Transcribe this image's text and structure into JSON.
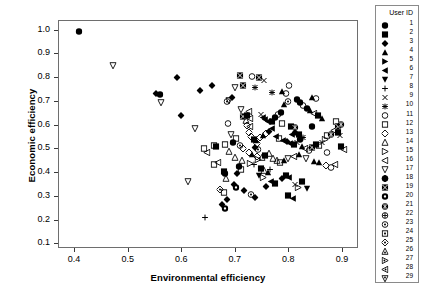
{
  "chart_data": {
    "type": "scatter",
    "title": "",
    "xlabel": "Environmental efficiency",
    "ylabel": "Economic efficiency",
    "xlim": [
      0.37,
      0.93
    ],
    "ylim": [
      0.08,
      1.04
    ],
    "xticks": [
      0.4,
      0.5,
      0.6,
      0.7,
      0.8,
      0.9
    ],
    "xtick_labels": [
      "0.4",
      "0.5",
      "0.6",
      "0.7",
      "0.8",
      "0.9"
    ],
    "yticks": [
      0.1,
      0.2,
      0.3,
      0.4,
      0.5,
      0.6,
      0.7,
      0.8,
      0.9,
      1.0
    ],
    "ytick_labels": [
      "0.1",
      "0.2",
      "0.3",
      "0.4",
      "0.5",
      "0.6",
      "0.7",
      "0.8",
      "0.9",
      "1.0"
    ],
    "grid": false,
    "legend_position": "right-outside",
    "legend_title": "User ID",
    "legend_entries": [
      {
        "id": "1",
        "marker": "filled-circle"
      },
      {
        "id": "2",
        "marker": "filled-square"
      },
      {
        "id": "3",
        "marker": "filled-diamond"
      },
      {
        "id": "4",
        "marker": "filled-triangle-up"
      },
      {
        "id": "5",
        "marker": "filled-triangle-right"
      },
      {
        "id": "6",
        "marker": "filled-triangle-left"
      },
      {
        "id": "7",
        "marker": "filled-triangle-down"
      },
      {
        "id": "8",
        "marker": "plus"
      },
      {
        "id": "9",
        "marker": "cross-x"
      },
      {
        "id": "10",
        "marker": "asterisk"
      },
      {
        "id": "11",
        "marker": "open-circle"
      },
      {
        "id": "12",
        "marker": "open-square"
      },
      {
        "id": "13",
        "marker": "open-diamond"
      },
      {
        "id": "14",
        "marker": "open-triangle-up"
      },
      {
        "id": "15",
        "marker": "open-triangle-right"
      },
      {
        "id": "16",
        "marker": "open-triangle-left"
      },
      {
        "id": "17",
        "marker": "open-triangle-down"
      },
      {
        "id": "18",
        "marker": "circle-plus-filled"
      },
      {
        "id": "19",
        "marker": "square-cross-filled"
      },
      {
        "id": "20",
        "marker": "circle-dot-filled"
      },
      {
        "id": "21",
        "marker": "circle-star-filled"
      },
      {
        "id": "22",
        "marker": "circle-plus"
      },
      {
        "id": "23",
        "marker": "circle-dot"
      },
      {
        "id": "24",
        "marker": "square-dot"
      },
      {
        "id": "25",
        "marker": "diamond-dot"
      },
      {
        "id": "26",
        "marker": "triangle-up-dot"
      },
      {
        "id": "27",
        "marker": "triangle-right-dot"
      },
      {
        "id": "28",
        "marker": "triangle-left-dot"
      },
      {
        "id": "29",
        "marker": "triangle-down-dot"
      }
    ],
    "points": [
      {
        "x": 0.409,
        "y": 0.998,
        "marker": "filled-circle"
      },
      {
        "x": 0.473,
        "y": 0.855,
        "marker": "open-triangle-down"
      },
      {
        "x": 0.552,
        "y": 0.738,
        "marker": "filled-diamond"
      },
      {
        "x": 0.56,
        "y": 0.733,
        "marker": "filled-circle"
      },
      {
        "x": 0.563,
        "y": 0.697,
        "marker": "open-triangle-down"
      },
      {
        "x": 0.593,
        "y": 0.803,
        "marker": "filled-diamond"
      },
      {
        "x": 0.6,
        "y": 0.646,
        "marker": "filled-diamond"
      },
      {
        "x": 0.635,
        "y": 0.748,
        "marker": "filled-diamond"
      },
      {
        "x": 0.625,
        "y": 0.59,
        "marker": "open-triangle-down"
      },
      {
        "x": 0.612,
        "y": 0.365,
        "marker": "open-triangle-down"
      },
      {
        "x": 0.645,
        "y": 0.216,
        "marker": "plus"
      },
      {
        "x": 0.658,
        "y": 0.771,
        "marker": "filled-diamond"
      },
      {
        "x": 0.662,
        "y": 0.516,
        "marker": "open-square"
      },
      {
        "x": 0.665,
        "y": 0.513,
        "marker": "filled-square"
      },
      {
        "x": 0.681,
        "y": 0.521,
        "marker": "open-square"
      },
      {
        "x": 0.686,
        "y": 0.702,
        "marker": "circle-dot"
      },
      {
        "x": 0.69,
        "y": 0.706,
        "marker": "open-triangle-down"
      },
      {
        "x": 0.694,
        "y": 0.718,
        "marker": "filled-diamond"
      },
      {
        "x": 0.7,
        "y": 0.762,
        "marker": "open-triangle-down"
      },
      {
        "x": 0.709,
        "y": 0.814,
        "marker": "square-cross-filled"
      },
      {
        "x": 0.716,
        "y": 0.772,
        "marker": "square-cross-filled"
      },
      {
        "x": 0.688,
        "y": 0.612,
        "marker": "open-circle"
      },
      {
        "x": 0.693,
        "y": 0.563,
        "marker": "open-triangle-down"
      },
      {
        "x": 0.7,
        "y": 0.467,
        "marker": "open-triangle-up"
      },
      {
        "x": 0.668,
        "y": 0.445,
        "marker": "open-triangle-left"
      },
      {
        "x": 0.661,
        "y": 0.438,
        "marker": "open-square"
      },
      {
        "x": 0.679,
        "y": 0.408,
        "marker": "filled-square"
      },
      {
        "x": 0.681,
        "y": 0.401,
        "marker": "filled-circle"
      },
      {
        "x": 0.684,
        "y": 0.381,
        "marker": "open-triangle-up"
      },
      {
        "x": 0.673,
        "y": 0.333,
        "marker": "diamond-dot"
      },
      {
        "x": 0.679,
        "y": 0.318,
        "marker": "open-square"
      },
      {
        "x": 0.686,
        "y": 0.289,
        "marker": "filled-diamond"
      },
      {
        "x": 0.677,
        "y": 0.268,
        "marker": "filled-diamond"
      },
      {
        "x": 0.682,
        "y": 0.252,
        "marker": "circle-dot-filled"
      },
      {
        "x": 0.723,
        "y": 0.601,
        "marker": "open-diamond"
      },
      {
        "x": 0.729,
        "y": 0.596,
        "marker": "open-triangle-left"
      },
      {
        "x": 0.726,
        "y": 0.572,
        "marker": "open-diamond"
      },
      {
        "x": 0.731,
        "y": 0.556,
        "marker": "open-diamond"
      },
      {
        "x": 0.735,
        "y": 0.545,
        "marker": "filled-square"
      },
      {
        "x": 0.739,
        "y": 0.538,
        "marker": "filled-triangle-up"
      },
      {
        "x": 0.742,
        "y": 0.525,
        "marker": "open-diamond"
      },
      {
        "x": 0.737,
        "y": 0.51,
        "marker": "filled-diamond"
      },
      {
        "x": 0.744,
        "y": 0.502,
        "marker": "circle-dot"
      },
      {
        "x": 0.727,
        "y": 0.489,
        "marker": "open-diamond"
      },
      {
        "x": 0.733,
        "y": 0.478,
        "marker": "filled-triangle-up"
      },
      {
        "x": 0.741,
        "y": 0.47,
        "marker": "open-diamond"
      },
      {
        "x": 0.72,
        "y": 0.624,
        "marker": "open-triangle-up"
      },
      {
        "x": 0.715,
        "y": 0.64,
        "marker": "square-cross-filled"
      },
      {
        "x": 0.722,
        "y": 0.645,
        "marker": "filled-square"
      },
      {
        "x": 0.728,
        "y": 0.632,
        "marker": "open-triangle-left"
      },
      {
        "x": 0.748,
        "y": 0.648,
        "marker": "cross-x"
      },
      {
        "x": 0.752,
        "y": 0.636,
        "marker": "filled-triangle-left"
      },
      {
        "x": 0.757,
        "y": 0.628,
        "marker": "filled-triangle-left"
      },
      {
        "x": 0.762,
        "y": 0.62,
        "marker": "filled-triangle-left"
      },
      {
        "x": 0.769,
        "y": 0.617,
        "marker": "filled-square"
      },
      {
        "x": 0.775,
        "y": 0.634,
        "marker": "filled-circle"
      },
      {
        "x": 0.781,
        "y": 0.648,
        "marker": "open-circle"
      },
      {
        "x": 0.786,
        "y": 0.657,
        "marker": "filled-circle"
      },
      {
        "x": 0.792,
        "y": 0.69,
        "marker": "filled-triangle-up"
      },
      {
        "x": 0.799,
        "y": 0.702,
        "marker": "circle-dot"
      },
      {
        "x": 0.788,
        "y": 0.612,
        "marker": "open-square"
      },
      {
        "x": 0.805,
        "y": 0.6,
        "marker": "filled-square"
      },
      {
        "x": 0.812,
        "y": 0.592,
        "marker": "circle-star-filled"
      },
      {
        "x": 0.77,
        "y": 0.588,
        "marker": "filled-triangle-left"
      },
      {
        "x": 0.764,
        "y": 0.576,
        "marker": "filled-diamond"
      },
      {
        "x": 0.758,
        "y": 0.568,
        "marker": "open-diamond"
      },
      {
        "x": 0.752,
        "y": 0.559,
        "marker": "filled-triangle-up"
      },
      {
        "x": 0.747,
        "y": 0.551,
        "marker": "open-diamond"
      },
      {
        "x": 0.776,
        "y": 0.556,
        "marker": "filled-triangle-left"
      },
      {
        "x": 0.783,
        "y": 0.548,
        "marker": "open-square"
      },
      {
        "x": 0.79,
        "y": 0.54,
        "marker": "filled-triangle-left"
      },
      {
        "x": 0.797,
        "y": 0.534,
        "marker": "filled-diamond"
      },
      {
        "x": 0.803,
        "y": 0.528,
        "marker": "filled-triangle-left"
      },
      {
        "x": 0.81,
        "y": 0.522,
        "marker": "filled-square"
      },
      {
        "x": 0.816,
        "y": 0.53,
        "marker": "cross-x"
      },
      {
        "x": 0.822,
        "y": 0.543,
        "marker": "filled-circle"
      },
      {
        "x": 0.827,
        "y": 0.553,
        "marker": "asterisk"
      },
      {
        "x": 0.819,
        "y": 0.566,
        "marker": "filled-square"
      },
      {
        "x": 0.813,
        "y": 0.572,
        "marker": "filled-diamond"
      },
      {
        "x": 0.807,
        "y": 0.564,
        "marker": "filled-triangle-left"
      },
      {
        "x": 0.825,
        "y": 0.513,
        "marker": "filled-triangle-up"
      },
      {
        "x": 0.831,
        "y": 0.505,
        "marker": "open-triangle-left"
      },
      {
        "x": 0.838,
        "y": 0.498,
        "marker": "open-circle"
      },
      {
        "x": 0.845,
        "y": 0.511,
        "marker": "square-cross-filled"
      },
      {
        "x": 0.851,
        "y": 0.523,
        "marker": "filled-square"
      },
      {
        "x": 0.857,
        "y": 0.516,
        "marker": "open-square"
      },
      {
        "x": 0.862,
        "y": 0.53,
        "marker": "cross-x"
      },
      {
        "x": 0.868,
        "y": 0.545,
        "marker": "open-triangle-right"
      },
      {
        "x": 0.873,
        "y": 0.558,
        "marker": "open-square"
      },
      {
        "x": 0.88,
        "y": 0.566,
        "marker": "circle-star-filled"
      },
      {
        "x": 0.886,
        "y": 0.58,
        "marker": "open-triangle-left"
      },
      {
        "x": 0.892,
        "y": 0.572,
        "marker": "filled-square"
      },
      {
        "x": 0.897,
        "y": 0.56,
        "marker": "cross-x"
      },
      {
        "x": 0.888,
        "y": 0.62,
        "marker": "open-square"
      },
      {
        "x": 0.862,
        "y": 0.631,
        "marker": "filled-triangle-up"
      },
      {
        "x": 0.855,
        "y": 0.644,
        "marker": "filled-square"
      },
      {
        "x": 0.848,
        "y": 0.652,
        "marker": "open-triangle-left"
      },
      {
        "x": 0.841,
        "y": 0.665,
        "marker": "filled-triangle-up"
      },
      {
        "x": 0.835,
        "y": 0.673,
        "marker": "filled-circle"
      },
      {
        "x": 0.828,
        "y": 0.687,
        "marker": "open-circle"
      },
      {
        "x": 0.822,
        "y": 0.699,
        "marker": "filled-circle"
      },
      {
        "x": 0.816,
        "y": 0.712,
        "marker": "filled-circle"
      },
      {
        "x": 0.845,
        "y": 0.722,
        "marker": "filled-triangle-up"
      },
      {
        "x": 0.851,
        "y": 0.715,
        "marker": "open-circle"
      },
      {
        "x": 0.795,
        "y": 0.738,
        "marker": "open-circle"
      },
      {
        "x": 0.788,
        "y": 0.745,
        "marker": "filled-triangle-up"
      },
      {
        "x": 0.77,
        "y": 0.743,
        "marker": "asterisk"
      },
      {
        "x": 0.738,
        "y": 0.764,
        "marker": "asterisk"
      },
      {
        "x": 0.755,
        "y": 0.792,
        "marker": "cross-x"
      },
      {
        "x": 0.745,
        "y": 0.806,
        "marker": "square-cross-filled"
      },
      {
        "x": 0.733,
        "y": 0.81,
        "marker": "open-circle"
      },
      {
        "x": 0.801,
        "y": 0.77,
        "marker": "open-circle"
      },
      {
        "x": 0.763,
        "y": 0.485,
        "marker": "open-triangle-up"
      },
      {
        "x": 0.757,
        "y": 0.474,
        "marker": "filled-square"
      },
      {
        "x": 0.75,
        "y": 0.468,
        "marker": "open-triangle-up"
      },
      {
        "x": 0.744,
        "y": 0.46,
        "marker": "open-triangle-right"
      },
      {
        "x": 0.771,
        "y": 0.463,
        "marker": "open-triangle-up"
      },
      {
        "x": 0.778,
        "y": 0.455,
        "marker": "open-triangle-up"
      },
      {
        "x": 0.785,
        "y": 0.448,
        "marker": "open-square"
      },
      {
        "x": 0.792,
        "y": 0.455,
        "marker": "filled-triangle-up"
      },
      {
        "x": 0.799,
        "y": 0.462,
        "marker": "open-triangle-down"
      },
      {
        "x": 0.81,
        "y": 0.47,
        "marker": "open-triangle-left"
      },
      {
        "x": 0.82,
        "y": 0.478,
        "marker": "filled-triangle-up"
      },
      {
        "x": 0.833,
        "y": 0.465,
        "marker": "open-triangle-down"
      },
      {
        "x": 0.847,
        "y": 0.452,
        "marker": "filled-triangle-up"
      },
      {
        "x": 0.858,
        "y": 0.445,
        "marker": "filled-triangle-up"
      },
      {
        "x": 0.87,
        "y": 0.432,
        "marker": "open-diamond"
      },
      {
        "x": 0.88,
        "y": 0.424,
        "marker": "open-circle"
      },
      {
        "x": 0.887,
        "y": 0.436,
        "marker": "open-triangle-left"
      },
      {
        "x": 0.736,
        "y": 0.436,
        "marker": "plus"
      },
      {
        "x": 0.729,
        "y": 0.444,
        "marker": "open-triangle-right"
      },
      {
        "x": 0.714,
        "y": 0.455,
        "marker": "open-triangle-up"
      },
      {
        "x": 0.707,
        "y": 0.43,
        "marker": "filled-circle"
      },
      {
        "x": 0.712,
        "y": 0.418,
        "marker": "open-square"
      },
      {
        "x": 0.705,
        "y": 0.4,
        "marker": "filled-diamond"
      },
      {
        "x": 0.698,
        "y": 0.352,
        "marker": "filled-diamond"
      },
      {
        "x": 0.703,
        "y": 0.34,
        "marker": "circle-dot-filled"
      },
      {
        "x": 0.717,
        "y": 0.33,
        "marker": "filled-diamond"
      },
      {
        "x": 0.746,
        "y": 0.392,
        "marker": "filled-triangle-down"
      },
      {
        "x": 0.753,
        "y": 0.384,
        "marker": "open-triangle-right"
      },
      {
        "x": 0.768,
        "y": 0.368,
        "marker": "filled-triangle-left"
      },
      {
        "x": 0.775,
        "y": 0.36,
        "marker": "filled-square"
      },
      {
        "x": 0.788,
        "y": 0.38,
        "marker": "filled-diamond"
      },
      {
        "x": 0.795,
        "y": 0.392,
        "marker": "filled-square"
      },
      {
        "x": 0.802,
        "y": 0.385,
        "marker": "filled-triangle-left"
      },
      {
        "x": 0.812,
        "y": 0.352,
        "marker": "cross-x"
      },
      {
        "x": 0.818,
        "y": 0.343,
        "marker": "open-triangle-right"
      },
      {
        "x": 0.835,
        "y": 0.337,
        "marker": "filled-triangle-down"
      },
      {
        "x": 0.826,
        "y": 0.365,
        "marker": "filled-square"
      },
      {
        "x": 0.758,
        "y": 0.344,
        "marker": "filled-diamond"
      },
      {
        "x": 0.731,
        "y": 0.31,
        "marker": "circle-dot"
      },
      {
        "x": 0.737,
        "y": 0.298,
        "marker": "filled-diamond"
      },
      {
        "x": 0.808,
        "y": 0.296,
        "marker": "filled-triangle-left"
      },
      {
        "x": 0.8,
        "y": 0.308,
        "marker": "filled-square"
      },
      {
        "x": 0.748,
        "y": 0.42,
        "marker": "filled-square"
      },
      {
        "x": 0.755,
        "y": 0.412,
        "marker": "open-triangle-up"
      },
      {
        "x": 0.762,
        "y": 0.405,
        "marker": "filled-triangle-up"
      },
      {
        "x": 0.766,
        "y": 0.418,
        "marker": "plus"
      },
      {
        "x": 0.726,
        "y": 0.662,
        "marker": "open-triangle-left"
      },
      {
        "x": 0.712,
        "y": 0.67,
        "marker": "open-triangle-down"
      },
      {
        "x": 0.703,
        "y": 0.548,
        "marker": "open-square"
      },
      {
        "x": 0.697,
        "y": 0.53,
        "marker": "filled-circle"
      },
      {
        "x": 0.709,
        "y": 0.516,
        "marker": "circle-dot"
      },
      {
        "x": 0.716,
        "y": 0.504,
        "marker": "open-diamond"
      },
      {
        "x": 0.69,
        "y": 0.492,
        "marker": "open-triangle-up"
      },
      {
        "x": 0.845,
        "y": 0.596,
        "marker": "filled-circle"
      },
      {
        "x": 0.872,
        "y": 0.49,
        "marker": "open-circle"
      },
      {
        "x": 0.898,
        "y": 0.512,
        "marker": "filled-square"
      },
      {
        "x": 0.903,
        "y": 0.5,
        "marker": "open-triangle-left"
      },
      {
        "x": 0.893,
        "y": 0.6,
        "marker": "square-cross-filled"
      },
      {
        "x": 0.899,
        "y": 0.608,
        "marker": "circle-star-filled"
      },
      {
        "x": 0.642,
        "y": 0.505,
        "marker": "open-square"
      },
      {
        "x": 0.648,
        "y": 0.488,
        "marker": "open-triangle-left"
      }
    ]
  }
}
